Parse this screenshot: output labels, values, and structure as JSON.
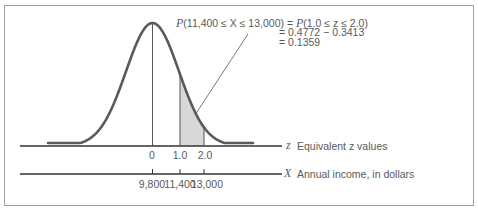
{
  "figure": {
    "formula": {
      "line1_prefix": "P",
      "line1_rest": "(11,400 ≤ X ≤ 13,000) = ",
      "line1_p2": "P",
      "line1_rest2": "(1.0 ≤ z ≤ 2.0)",
      "line2": "= 0.4772 − 0.3413",
      "line3": "= 0.1359"
    },
    "z_axis": {
      "symbol": "z",
      "label": "Equivalent z values",
      "ticks": [
        "0",
        "1.0",
        "2.0"
      ]
    },
    "x_axis": {
      "symbol": "X",
      "label": "Annual income, in dollars",
      "ticks": [
        "9,800",
        "11,400",
        "13,000"
      ]
    },
    "colors": {
      "curve": "#5a5a5a",
      "shade": "#d9d9d9",
      "axis": "#333333",
      "frame": "#9a9a9a"
    }
  },
  "chart_data": {
    "type": "area",
    "title": "P(11,400 ≤ X ≤ 13,000) = P(1.0 ≤ z ≤ 2.0) = 0.4772 − 0.3413 = 0.1359",
    "distribution": "normal",
    "mean_X": 9800,
    "sd_X": 1600,
    "shaded_interval_z": [
      1.0,
      2.0
    ],
    "shaded_interval_X": [
      11400,
      13000
    ],
    "shaded_probability": 0.1359,
    "cumulative_areas": {
      "z_0_to_2": 0.4772,
      "z_0_to_1": 0.3413
    },
    "x_axes": [
      {
        "name": "z",
        "label": "Equivalent z values",
        "ticks": [
          0,
          1.0,
          2.0
        ]
      },
      {
        "name": "X",
        "label": "Annual income, in dollars",
        "ticks": [
          9800,
          11400,
          13000
        ]
      }
    ],
    "grid": false
  }
}
